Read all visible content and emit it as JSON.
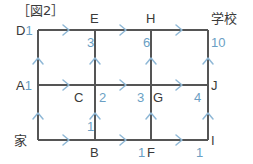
{
  "figure": {
    "title": "［図2］",
    "type": "lattice-path-grid",
    "line_color": "#555555",
    "arrow_color": "#8fb8d6",
    "count_color": "#6b9fc4",
    "label_color": "#3a3a3a"
  },
  "nodes": {
    "home": {
      "label": "家",
      "count": ""
    },
    "a": {
      "label": "A",
      "count": "1"
    },
    "b": {
      "label": "B",
      "count": "1"
    },
    "c": {
      "label": "C",
      "count": "2"
    },
    "d": {
      "label": "D",
      "count": "1"
    },
    "e": {
      "label": "E",
      "count": "3"
    },
    "f": {
      "label": "F",
      "count": "1"
    },
    "g": {
      "label": "G",
      "count": "3"
    },
    "h": {
      "label": "H",
      "count": "6"
    },
    "i": {
      "label": "I",
      "count": "1"
    },
    "j": {
      "label": "J",
      "count": "4"
    },
    "school": {
      "label": "学校",
      "count": "10"
    }
  },
  "icons": {
    "arrow_right": "right-arrow-icon",
    "arrow_up": "up-arrow-icon"
  }
}
